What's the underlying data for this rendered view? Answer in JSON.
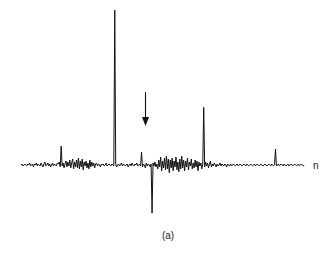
{
  "figure": {
    "caption": "(a)",
    "axis_label_x": "n",
    "annotation": {
      "type": "arrow",
      "direction": "down",
      "x": 145,
      "y_top": 92,
      "y_bottom": 126
    }
  },
  "chart_data": {
    "type": "line",
    "title": "",
    "subtitle": "",
    "xlabel": "n",
    "ylabel": "",
    "grid": false,
    "legend": null,
    "axis_line_y": 0,
    "xlim": [
      0,
      300
    ],
    "ylim": [
      -53,
      157
    ],
    "baseline_color": "#111111",
    "annotations": [
      {
        "label": "arrow",
        "x": 126,
        "points_to": "small positive spike",
        "y_top": 73,
        "y_bottom": 40
      },
      {
        "label": "(a)",
        "x": 139,
        "y": -68
      }
    ],
    "major_spikes": [
      {
        "x": 42,
        "value": 19
      },
      {
        "x": 98,
        "value": 156
      },
      {
        "x": 126,
        "value": 13
      },
      {
        "x": 137,
        "value": -50
      },
      {
        "x": 185,
        "value": 58
      },
      {
        "x": 267,
        "value": 16
      }
    ],
    "x": [
      0,
      1,
      2,
      3,
      4,
      5,
      6,
      7,
      8,
      9,
      10,
      11,
      12,
      13,
      14,
      15,
      16,
      17,
      18,
      19,
      20,
      21,
      22,
      23,
      24,
      25,
      26,
      27,
      28,
      29,
      30,
      31,
      32,
      33,
      34,
      35,
      36,
      37,
      38,
      39,
      40,
      41,
      42,
      43,
      44,
      45,
      46,
      47,
      48,
      49,
      50,
      51,
      52,
      53,
      54,
      55,
      56,
      57,
      58,
      59,
      60,
      61,
      62,
      63,
      64,
      65,
      66,
      67,
      68,
      69,
      70,
      71,
      72,
      73,
      74,
      75,
      76,
      77,
      78,
      79,
      80,
      81,
      82,
      83,
      84,
      85,
      86,
      87,
      88,
      89,
      90,
      91,
      92,
      93,
      94,
      95,
      96,
      97,
      98,
      99,
      100,
      101,
      102,
      103,
      104,
      105,
      106,
      107,
      108,
      109,
      110,
      111,
      112,
      113,
      114,
      115,
      116,
      117,
      118,
      119,
      120,
      121,
      122,
      123,
      124,
      125,
      126,
      127,
      128,
      129,
      130,
      131,
      132,
      133,
      134,
      135,
      136,
      137,
      138,
      139,
      140,
      141,
      142,
      143,
      144,
      145,
      146,
      147,
      148,
      149,
      150,
      151,
      152,
      153,
      154,
      155,
      156,
      157,
      158,
      159,
      160,
      161,
      162,
      163,
      164,
      165,
      166,
      167,
      168,
      169,
      170,
      171,
      172,
      173,
      174,
      175,
      176,
      177,
      178,
      179,
      180,
      181,
      182,
      183,
      184,
      185,
      186,
      187,
      188,
      189,
      190,
      191,
      192,
      193,
      194,
      195,
      196,
      197,
      198,
      199,
      200,
      201,
      202,
      203,
      204,
      205,
      206,
      207,
      208,
      209,
      210,
      211,
      212,
      213,
      214,
      215,
      216,
      217,
      218,
      219,
      220,
      221,
      222,
      223,
      224,
      225,
      226,
      227,
      228,
      229,
      230,
      231,
      232,
      233,
      234,
      235,
      236,
      237,
      238,
      239,
      240,
      241,
      242,
      243,
      244,
      245,
      246,
      247,
      248,
      249,
      250,
      251,
      252,
      253,
      254,
      255,
      256,
      257,
      258,
      259,
      260,
      261,
      262,
      263,
      264,
      265,
      266,
      267,
      268,
      269,
      270,
      271,
      272,
      273,
      274,
      275,
      276,
      277,
      278,
      279,
      280,
      281,
      282,
      283,
      284,
      285,
      286,
      287,
      288,
      289,
      290,
      291,
      292,
      293,
      294,
      295,
      296,
      297,
      298,
      299
    ],
    "y": [
      0,
      1,
      -1,
      0,
      1,
      0,
      -1,
      1,
      0,
      2,
      -1,
      0,
      1,
      -2,
      1,
      0,
      2,
      -1,
      1,
      0,
      -1,
      2,
      0,
      -2,
      1,
      3,
      -1,
      0,
      2,
      -1,
      1,
      -2,
      0,
      2,
      -1,
      1,
      0,
      -1,
      2,
      1,
      3,
      -2,
      19,
      -1,
      2,
      -3,
      1,
      4,
      -2,
      3,
      -1,
      5,
      -3,
      2,
      6,
      -4,
      3,
      -2,
      5,
      -3,
      7,
      -4,
      4,
      -2,
      6,
      -5,
      3,
      -1,
      4,
      -3,
      2,
      -4,
      5,
      -2,
      3,
      -1,
      2,
      -3,
      1,
      2,
      -1,
      1,
      0,
      -2,
      1,
      0,
      1,
      -1,
      0,
      2,
      -1,
      0,
      1,
      0,
      -1,
      1,
      0,
      -1,
      156,
      1,
      -2,
      0,
      1,
      -1,
      0,
      2,
      -1,
      1,
      0,
      -1,
      0,
      1,
      -2,
      0,
      1,
      -1,
      2,
      0,
      -1,
      1,
      0,
      2,
      -1,
      0,
      1,
      -1,
      13,
      -2,
      1,
      0,
      -3,
      2,
      -1,
      1,
      0,
      -2,
      1,
      -50,
      2,
      -1,
      3,
      -2,
      1,
      -4,
      5,
      -2,
      8,
      -6,
      4,
      -3,
      7,
      -5,
      9,
      -4,
      6,
      -8,
      5,
      -3,
      7,
      -6,
      4,
      -2,
      8,
      -5,
      3,
      -7,
      6,
      -4,
      9,
      -3,
      5,
      -6,
      4,
      -2,
      7,
      -5,
      3,
      -1,
      6,
      -4,
      2,
      -3,
      5,
      -2,
      4,
      -6,
      3,
      -1,
      2,
      -4,
      1,
      58,
      -2,
      3,
      -1,
      2,
      -3,
      1,
      4,
      -2,
      1,
      -1,
      2,
      0,
      -2,
      1,
      -1,
      0,
      2,
      -1,
      1,
      0,
      -1,
      1,
      0,
      -2,
      1,
      0,
      -1,
      1,
      -1,
      0,
      1,
      0,
      -1,
      0,
      1,
      -1,
      0,
      1,
      0,
      -1,
      0,
      1,
      0,
      -1,
      1,
      0,
      -1,
      0,
      1,
      0,
      -1,
      0,
      1,
      -1,
      0,
      1,
      0,
      -1,
      0,
      1,
      0,
      -1,
      0,
      1,
      0,
      -1,
      0,
      1,
      0,
      -1,
      1,
      0,
      -1,
      0,
      16,
      -1,
      0,
      1,
      -1,
      0,
      1,
      0,
      -1,
      1,
      0,
      -1,
      0,
      1,
      -1,
      0,
      1,
      0,
      -1,
      0,
      1,
      0,
      -1,
      0,
      1,
      -1,
      0,
      1,
      0,
      -1,
      0
    ]
  }
}
